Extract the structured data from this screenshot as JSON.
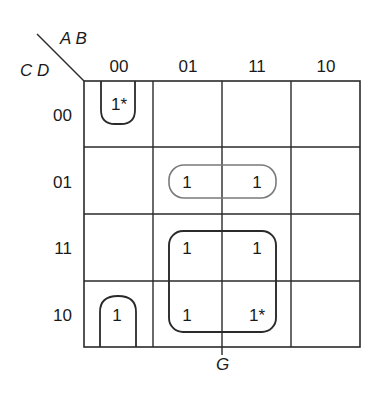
{
  "diagram": {
    "type": "karnaugh-map",
    "variables": {
      "column_vars": "A B",
      "row_vars": "C D"
    },
    "column_headers": [
      "00",
      "01",
      "11",
      "10"
    ],
    "row_headers": [
      "00",
      "01",
      "11",
      "10"
    ],
    "cells": [
      [
        "1*",
        "",
        "",
        ""
      ],
      [
        "",
        "1",
        "1",
        ""
      ],
      [
        "",
        "1",
        "1",
        ""
      ],
      [
        "1",
        "1",
        "1*",
        ""
      ]
    ],
    "groups": [
      {
        "name": "corner-pair-column-00",
        "cells": [
          [
            0,
            0
          ],
          [
            3,
            0
          ]
        ],
        "style": "dark",
        "wraps": true
      },
      {
        "name": "row-01-pair",
        "cells": [
          [
            1,
            1
          ],
          [
            1,
            2
          ]
        ],
        "style": "light"
      },
      {
        "name": "quad-G",
        "cells": [
          [
            2,
            1
          ],
          [
            2,
            2
          ],
          [
            3,
            1
          ],
          [
            3,
            2
          ]
        ],
        "style": "dark"
      }
    ],
    "group_label": "G",
    "colors": {
      "line": "#2a2a2a",
      "light_loop": "#7a7a7a",
      "text": "#1a1a1a"
    }
  },
  "labels": {
    "ab": "A B",
    "cd": "C D",
    "g": "G",
    "col0": "00",
    "col1": "01",
    "col2": "11",
    "col3": "10",
    "row0": "00",
    "row1": "01",
    "row2": "11",
    "row3": "10",
    "c00": "1*",
    "c11": "1",
    "c12": "1",
    "c21": "1",
    "c22": "1",
    "c30": "1",
    "c31": "1",
    "c32": "1*"
  }
}
